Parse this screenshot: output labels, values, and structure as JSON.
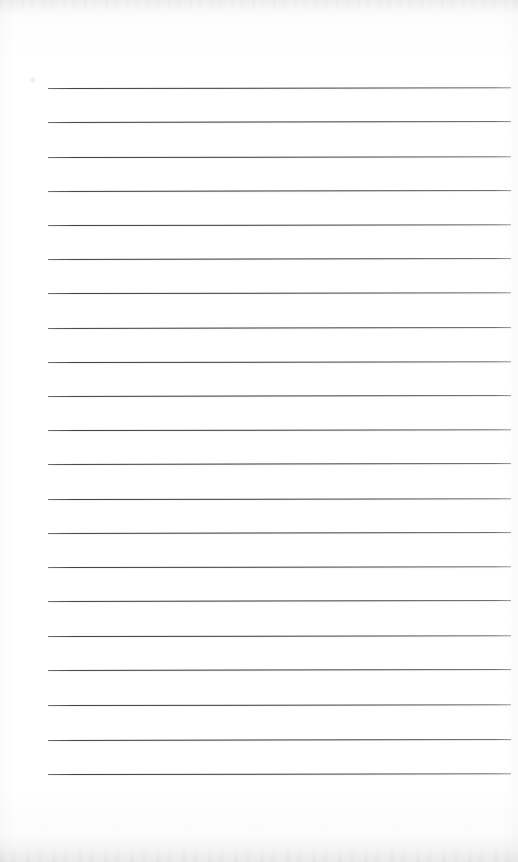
{
  "document": {
    "kind": "scanned-lined-paper",
    "title": "Blank ruled notepad page",
    "page_width": 518,
    "page_height": 862,
    "orientation": "portrait",
    "text_content": "",
    "has_handwriting": false,
    "has_printed_text": false
  },
  "paper": {
    "background_color": "#fdfdfe",
    "edge_shadow_color": "#f2f2f3",
    "texture": "faint scanner grain"
  },
  "ruling": {
    "line_color": "#34373c",
    "line_count": 21,
    "line_thickness_px": 1,
    "left_margin_px": 48,
    "right_edge_px": 511,
    "first_line_y_px": 88,
    "line_spacing_px": 34.3,
    "lines": [
      {
        "index": 1,
        "y": 88,
        "x_start": 48,
        "x_end": 511,
        "tilt_deg": -0.1
      },
      {
        "index": 2,
        "y": 122,
        "x_start": 48,
        "x_end": 511,
        "tilt_deg": -0.12
      },
      {
        "index": 3,
        "y": 157,
        "x_start": 48,
        "x_end": 511,
        "tilt_deg": -0.1
      },
      {
        "index": 4,
        "y": 191,
        "x_start": 48,
        "x_end": 511,
        "tilt_deg": -0.11
      },
      {
        "index": 5,
        "y": 225,
        "x_start": 48,
        "x_end": 511,
        "tilt_deg": -0.1
      },
      {
        "index": 6,
        "y": 259,
        "x_start": 48,
        "x_end": 511,
        "tilt_deg": -0.12
      },
      {
        "index": 7,
        "y": 293,
        "x_start": 48,
        "x_end": 511,
        "tilt_deg": -0.1
      },
      {
        "index": 8,
        "y": 328,
        "x_start": 48,
        "x_end": 511,
        "tilt_deg": -0.11
      },
      {
        "index": 9,
        "y": 362,
        "x_start": 48,
        "x_end": 511,
        "tilt_deg": -0.1
      },
      {
        "index": 10,
        "y": 396,
        "x_start": 48,
        "x_end": 511,
        "tilt_deg": -0.12
      },
      {
        "index": 11,
        "y": 430,
        "x_start": 48,
        "x_end": 511,
        "tilt_deg": -0.1
      },
      {
        "index": 12,
        "y": 464,
        "x_start": 48,
        "x_end": 511,
        "tilt_deg": -0.11
      },
      {
        "index": 13,
        "y": 499,
        "x_start": 48,
        "x_end": 511,
        "tilt_deg": -0.1
      },
      {
        "index": 14,
        "y": 533,
        "x_start": 48,
        "x_end": 511,
        "tilt_deg": -0.12
      },
      {
        "index": 15,
        "y": 567,
        "x_start": 48,
        "x_end": 511,
        "tilt_deg": -0.1
      },
      {
        "index": 16,
        "y": 601,
        "x_start": 48,
        "x_end": 511,
        "tilt_deg": -0.11
      },
      {
        "index": 17,
        "y": 636,
        "x_start": 48,
        "x_end": 511,
        "tilt_deg": -0.1
      },
      {
        "index": 18,
        "y": 670,
        "x_start": 48,
        "x_end": 511,
        "tilt_deg": -0.12
      },
      {
        "index": 19,
        "y": 705,
        "x_start": 48,
        "x_end": 511,
        "tilt_deg": -0.1
      },
      {
        "index": 20,
        "y": 740,
        "x_start": 48,
        "x_end": 511,
        "tilt_deg": -0.11
      },
      {
        "index": 21,
        "y": 774,
        "x_start": 48,
        "x_end": 511,
        "tilt_deg": -0.1
      }
    ]
  },
  "artifacts": {
    "smudges": [
      {
        "name": "top-left-speck",
        "x": 29,
        "y": 76,
        "width": 7,
        "height": 8
      }
    ],
    "edge_bands": [
      {
        "name": "top-scan-band",
        "y": 0,
        "height": 22
      },
      {
        "name": "bottom-scan-band",
        "y": 832,
        "height": 30
      }
    ]
  }
}
